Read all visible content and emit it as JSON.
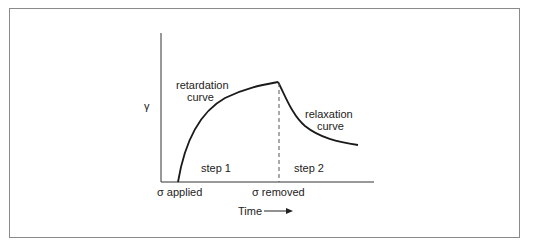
{
  "diagram": {
    "y_axis_label": "γ",
    "x_axis_label": "Time",
    "annotations": {
      "retardation_line1": "retardation",
      "retardation_line2": "curve",
      "relaxation_line1": "relaxation",
      "relaxation_line2": "curve",
      "step1": "step 1",
      "step2": "step 2",
      "sigma_applied": "σ applied",
      "sigma_removed": "σ removed"
    },
    "colors": {
      "line": "#1a1a1a",
      "frame": "#8a8a8a"
    }
  }
}
